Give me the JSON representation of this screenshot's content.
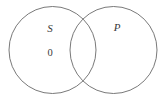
{
  "figure": {
    "type": "venn-diagram",
    "background_color": "#ffffff",
    "stroke_color": "#6a6a6a",
    "text_color": "#3a3a3a",
    "stroke_width": 0.9,
    "width": 167,
    "height": 102
  },
  "circles": [
    {
      "id": "circle-s",
      "name": "left-circle",
      "cx": 52.5,
      "cy": 50,
      "r": 43.5
    },
    {
      "id": "circle-p",
      "name": "right-circle",
      "cx": 113.5,
      "cy": 50,
      "r": 43.5
    }
  ],
  "labels": {
    "subject": {
      "text": "S",
      "x": 50,
      "y": 28
    },
    "predicate": {
      "text": "P",
      "x": 117,
      "y": 27
    },
    "empty_marker": {
      "text": "0",
      "x": 50,
      "y": 53
    }
  }
}
